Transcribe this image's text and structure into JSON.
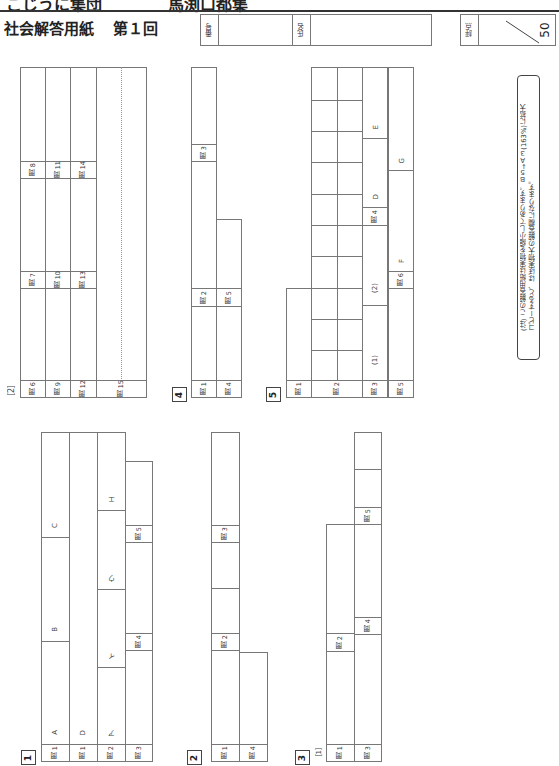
{
  "header": {
    "cut_text_left": "こじうに集団",
    "cut_text_right": "馬渕口都集",
    "title": "社会解答用紙",
    "round": "第１回",
    "number_label": "番号",
    "name_label": "氏名",
    "score_label": "評点",
    "score_max": "50"
  },
  "note": {
    "line1": "(注) この解答用紙は実物を縮小してあります。Ｂ５→Ａ３(163%)に拡大",
    "line2": "コピーすると、ほぼ実物大の解答欄になります。"
  },
  "sections": {
    "s1": {
      "label": "1",
      "q1a": "問 1",
      "q1d": "問 1",
      "q2": "問 2",
      "q3": "問 3",
      "q4": "問 4",
      "q5": "問 5",
      "A": "A",
      "B": "B",
      "C": "C",
      "D": "D",
      "a": "ア",
      "i": "イ",
      "u": "ウ",
      "e": "エ"
    },
    "s2": {
      "label": "2",
      "q1": "問 1",
      "q2": "問 2",
      "q3": "問 3",
      "q4": "問 4"
    },
    "s3": {
      "label": "3",
      "part": "［1］",
      "q1": "問 1",
      "q2": "問 2",
      "q3": "問 3",
      "q4": "問 4",
      "q5": "問 5"
    },
    "s3b": {
      "part": "［2］",
      "q6": "問 6",
      "q7": "問 7",
      "q8": "問 8",
      "q9": "問 9",
      "q10": "問 10",
      "q11": "問 11",
      "q12": "問 12",
      "q13": "問 13",
      "q14": "問 14",
      "q15": "問 15"
    },
    "s4": {
      "label": "4",
      "q1": "問 1",
      "q2": "問 2",
      "q3": "問 3",
      "q4": "問 4",
      "q5": "問 5"
    },
    "s5": {
      "label": "5",
      "q1": "問 1",
      "q2": "問 2",
      "q3": "問 3",
      "q4": "問 4",
      "q5": "問 5",
      "q6": "問 6",
      "p1": "(1)",
      "p2": "(2)",
      "D": "D",
      "E": "E",
      "F": "F",
      "G": "G"
    }
  }
}
